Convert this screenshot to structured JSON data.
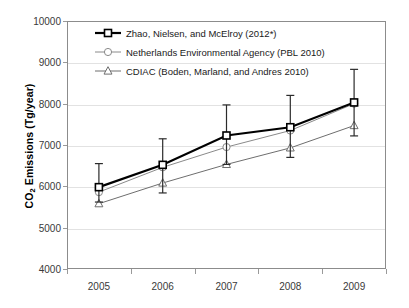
{
  "chart_data": {
    "type": "line",
    "title": "",
    "xlabel": "",
    "ylabel": "CO2 Emissions (Tg/year)",
    "ylabel_parts": {
      "pre": "CO",
      "sub": "2",
      "post": " Emissions (Tg/year)"
    },
    "categories": [
      "2005",
      "2006",
      "2007",
      "2008",
      "2009"
    ],
    "x": [
      2005,
      2006,
      2007,
      2008,
      2009
    ],
    "ylim": [
      4000,
      10000
    ],
    "ytick_labels": [
      "10000",
      "9000",
      "8000",
      "7000",
      "6000",
      "5000",
      "4000"
    ],
    "ytick_values": [
      10000,
      9000,
      8000,
      7000,
      6000,
      5000,
      4000
    ],
    "grid": true,
    "legend_position": "upper-left-inside",
    "series": [
      {
        "name": "Zhao, Nielsen, and McElroy (2012*)",
        "marker": "square",
        "color": "#000000",
        "values": [
          5980,
          6520,
          7230,
          7430,
          8030
        ],
        "error_low": [
          5620,
          5840,
          6530,
          6700,
          7220
        ],
        "error_high": [
          6550,
          7150,
          7970,
          8200,
          8830
        ]
      },
      {
        "name": "Netherlands Environmental Agency (PBL 2010)",
        "marker": "circle",
        "color": "#8a8a8a",
        "values": [
          5860,
          6460,
          6950,
          7350,
          8000
        ]
      },
      {
        "name": "CDIAC (Boden, Marland, and Andres 2010)",
        "marker": "triangle",
        "color": "#6e6e6e",
        "values": [
          5580,
          6080,
          6530,
          6930,
          7470
        ]
      }
    ]
  },
  "legend": {
    "items": [
      {
        "label": "Zhao, Nielsen, and McElroy (2012*)",
        "marker": "square"
      },
      {
        "label": "Netherlands Environmental Agency (PBL 2010)",
        "marker": "circle"
      },
      {
        "label": "CDIAC (Boden, Marland, and Andres 2010)",
        "marker": "triangle"
      }
    ]
  },
  "colors": {
    "series1": "#000000",
    "series2": "#8a8a8a",
    "series3": "#6e6e6e",
    "grid": "#e2e2e2",
    "frame": "#8c8c8c",
    "tick_text": "#3a3a3a"
  }
}
